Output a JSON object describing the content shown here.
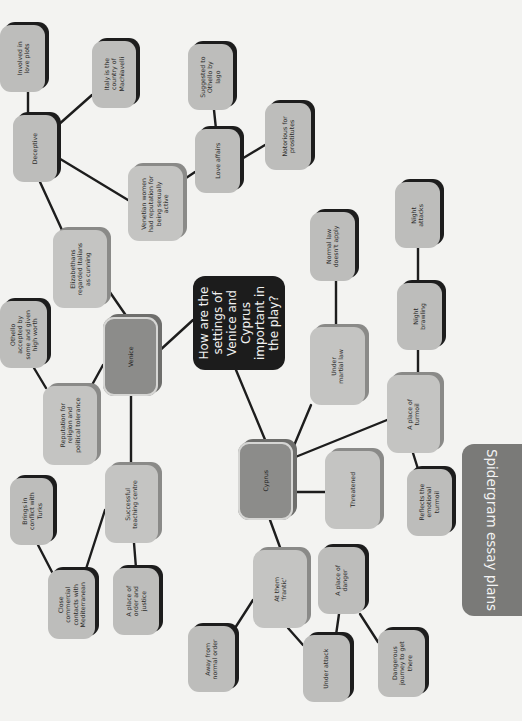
{
  "title": "Spidergram essay plans",
  "central_question": "How are the\nsettings of\nVenice and\nCyprus\nimportant in\nthe play?",
  "nodes": {
    "venice": "Venice",
    "cyprus": "Cyprus",
    "elizabethans": "Elizabethans\nregarded Italians\nas cunning",
    "deceptive": "Deceptive",
    "involved_love_plots": "Involved in\nlove plots",
    "italy_machiavelli": "Italy is the\ncountry of\nMachiavelli",
    "venetian_women": "Venetian women\nhad reputation for\nbeing sexually\nactive",
    "love_affairs": "Love affairs",
    "suggested_iago": "Suggested to\nOthello by\nIago",
    "notorious": "Notorious for\nprostitutes",
    "othello_accepted": "Othello\naccepted by\nsome and given\nhigh worth",
    "reputation": "Reputation for\nreligion and\npolitical tolerance",
    "successful_teaching": "Successful\nteaching centre",
    "brings_conflict": "Brings in\nconflict with\nTurks",
    "close_commercial": "Close\ncommercial\ncontacts with\nMediterranean",
    "place_order": "A place of\norder and\njustice",
    "under_martial_law": "Under\nmartial law",
    "normal_law": "Normal law\ndoesn't apply",
    "place_turmoil": "A place of\nturmoil",
    "night_brawling": "Night\nbrawling",
    "night_attacks": "Night\nattacks",
    "reflects_turmoil": "Reflects the\nemotional\nturmoil",
    "threatened": "Threatened",
    "at_them_frantic": "At them\n'frantic'",
    "place_danger": "A place of\ndanger",
    "away_normal_order": "Away from\nnormal order",
    "under_attack": "Under attack",
    "dangerous_journey": "Dangerous\njourney to get\nthere"
  },
  "colors": {
    "background": "#f3f3f1",
    "leaf": "#bdbdbb",
    "hub": "#8c8c8a",
    "center": "#1c1c1c",
    "tab": "#7a7a78",
    "line": "#1d1d1d"
  }
}
